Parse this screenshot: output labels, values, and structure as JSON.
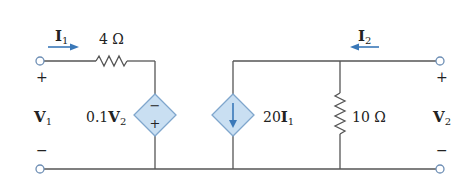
{
  "circuit": {
    "left_port": {
      "current_label": "I",
      "current_sub": "1",
      "voltage_label": "V",
      "voltage_sub": "1",
      "plus": "+",
      "minus": "−"
    },
    "right_port": {
      "current_label": "I",
      "current_sub": "2",
      "voltage_label": "V",
      "voltage_sub": "2",
      "plus": "+",
      "minus": "−"
    },
    "resistor_series": {
      "value": "4 Ω"
    },
    "resistor_shunt": {
      "value": "10 Ω"
    },
    "dependent_voltage_source": {
      "coef": "0.1",
      "var": "V",
      "sub": "2",
      "top_sign": "−",
      "bottom_sign": "+"
    },
    "dependent_current_source": {
      "coef": "20",
      "var": "I",
      "sub": "1",
      "direction": "down"
    },
    "colors": {
      "wire": "#555555",
      "terminal": "#6e8fb5",
      "arrow": "#3a78b8",
      "source_fill": "#c9dff2",
      "source_stroke": "#7fa6cc"
    }
  }
}
